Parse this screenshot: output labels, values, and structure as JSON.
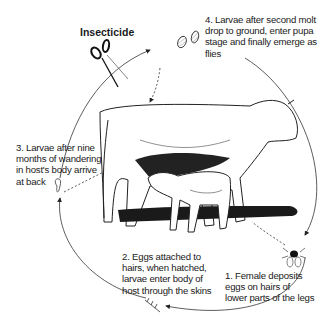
{
  "diagram": {
    "type": "life-cycle",
    "intervention": {
      "label": "Insecticide",
      "icon": "scissors-icon",
      "position": "between stage 3 and stage 4"
    },
    "stages": [
      {
        "number": 1,
        "text": "1. Female deposits\neggs on hairs of\nlower parts of the legs",
        "icon": "fly-icon"
      },
      {
        "number": 2,
        "text": "2. Eggs attached to\nhairs, when hatched,\nlarvae enter body of\nhost through the skins",
        "icon": "eggs-on-hair-icon"
      },
      {
        "number": 3,
        "text": "3. Larvae after nine\nmonths of wandering\nin host's body arrive\nat back",
        "icon": "larva-icon"
      },
      {
        "number": 4,
        "text": "4. Larvae after second molt\ndrop to ground, enter pupa\nstage and finally emerge as\nflies",
        "icon": "pupa-icon"
      }
    ],
    "center_image": "cow nursing calf",
    "colors": {
      "line": "#333333",
      "background": "#ffffff",
      "ink": "#111111"
    }
  }
}
